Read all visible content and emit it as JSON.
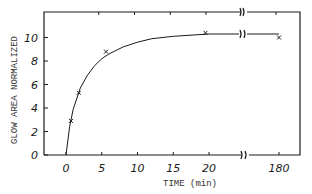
{
  "chart_data": {
    "type": "line",
    "title": "",
    "xlabel": "TIME (min)",
    "ylabel": "GLOW AREA NORMALIZED",
    "x_ticks": [
      "0",
      "5",
      "10",
      "15",
      "20",
      "180"
    ],
    "y_ticks": [
      "0",
      "2",
      "4",
      "6",
      "8",
      "10"
    ],
    "xlim": [
      -3,
      180
    ],
    "ylim": [
      0,
      12
    ],
    "axis_break": {
      "after_x": 20,
      "resume_x": 180,
      "symbol": "double-wave"
    },
    "grid": false,
    "legend": null,
    "series": [
      {
        "name": "measured",
        "marker": "x",
        "x": [
          0.7,
          1.8,
          5.6,
          19.5,
          180
        ],
        "y": [
          2.9,
          5.3,
          8.8,
          10.4,
          10.0
        ]
      },
      {
        "name": "fitted curve",
        "marker": "none",
        "x": [
          0,
          0.5,
          1,
          2,
          3,
          4,
          5,
          6,
          8,
          10,
          12,
          15,
          20,
          25,
          180
        ],
        "y": [
          0,
          2.4,
          3.9,
          5.7,
          6.8,
          7.6,
          8.2,
          8.6,
          9.2,
          9.6,
          9.9,
          10.1,
          10.3,
          10.3,
          10.3
        ]
      }
    ],
    "colors": {
      "ink": "#1a1a1a",
      "background": "#ffffff"
    }
  }
}
